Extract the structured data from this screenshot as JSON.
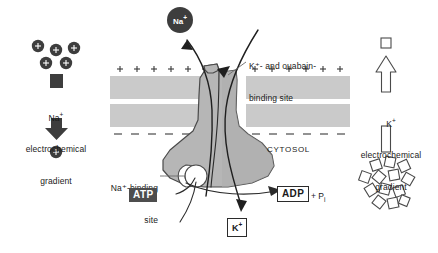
{
  "figure": {
    "membrane": {
      "outer_charge_symbol": "+",
      "outer_charge_count": 12,
      "inner_charge_symbol": "–",
      "inner_charge_count": 12,
      "cytosol_label": "CYTOSOL"
    },
    "left_gradient": {
      "ion_symbol": "+",
      "ion_count_top": 5,
      "ion_count_bottom": 1,
      "label_line1": "Na",
      "label_line1_sup": "+",
      "label_line2": "electrochemical",
      "label_line3": "gradient",
      "arrow_direction": "down"
    },
    "right_gradient": {
      "square_count_top": 1,
      "square_count_bottom": 13,
      "label_line1": "K",
      "label_line1_sup": "+",
      "label_line2": "electrochemical",
      "label_line3": "gradient",
      "arrow_direction": "up"
    },
    "transported_ion": {
      "label": "Na",
      "sup": "+"
    },
    "annotations": {
      "k_ouabain_line1": "K⁺- and ouabain-",
      "k_ouabain_line2": "binding site",
      "na_binding_line1": "Na⁺-binding",
      "na_binding_line2": "site"
    },
    "molecules": {
      "atp": "ATP",
      "adp": "ADP",
      "phosphate": "+ P",
      "phosphate_sub": "i",
      "potassium": "K",
      "potassium_sup": "+"
    },
    "colors": {
      "membrane_band": "#c9c9c9",
      "protein_body": "#b4b4b4",
      "protein_outline": "#4a4a4a",
      "ion_dark": "#3d3d3d",
      "atp_box": "#4d4d4d",
      "text": "#1a1a1a",
      "background": "#ffffff"
    }
  }
}
